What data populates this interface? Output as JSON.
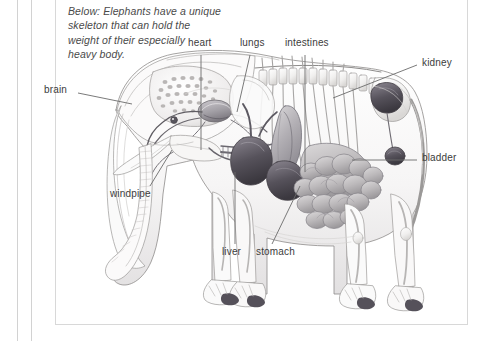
{
  "page": {
    "background": "#ffffff",
    "border_color": "#d8d8d8",
    "rule_color": "#d2d2d2"
  },
  "caption": {
    "text": "Below: Elephants have a unique skeleton that can hold the weight of their especially heavy body.",
    "line1": "Below: Elephants have a unique",
    "line2": "skeleton that can hold the",
    "line3": "weight of their especially",
    "line4": "heavy body.",
    "style": "italic",
    "color": "#4a4a4a"
  },
  "figure": {
    "ink_color": "#6f6f6f",
    "organ_fill_dark": "#4e4a52",
    "organ_fill_mid": "#9a979c",
    "organ_fill_light": "#cfcdd0",
    "bone_fill": "#f2f1f0",
    "toenail_fill": "#55515a"
  },
  "labels": [
    {
      "id": "brain",
      "text": "brain",
      "x": 44,
      "y": 89,
      "align": "left"
    },
    {
      "id": "heart",
      "text": "heart",
      "x": 188,
      "y": 42,
      "align": "left"
    },
    {
      "id": "lungs",
      "text": "lungs",
      "x": 240,
      "y": 42,
      "align": "left"
    },
    {
      "id": "intestines",
      "text": "intestines",
      "x": 285,
      "y": 42,
      "align": "left"
    },
    {
      "id": "kidney",
      "text": "kidney",
      "x": 420,
      "y": 62,
      "align": "left"
    },
    {
      "id": "bladder",
      "text": "bladder",
      "x": 420,
      "y": 157,
      "align": "left"
    },
    {
      "id": "windpipe",
      "text": "windpipe",
      "x": 110,
      "y": 193,
      "align": "left"
    },
    {
      "id": "liver",
      "text": "liver",
      "x": 222,
      "y": 251,
      "align": "left"
    },
    {
      "id": "stomach",
      "text": "stomach",
      "x": 256,
      "y": 251,
      "align": "left"
    }
  ],
  "leader_lines": [
    {
      "id": "lead-brain",
      "x1": 78,
      "y1": 93,
      "x2": 132,
      "y2": 104
    },
    {
      "id": "lead-heart",
      "x1": 201,
      "y1": 55,
      "x2": 201,
      "y2": 150
    },
    {
      "id": "lead-lungs",
      "x1": 250,
      "y1": 55,
      "x2": 237,
      "y2": 112
    },
    {
      "id": "lead-intestines",
      "x1": 305,
      "y1": 55,
      "x2": 305,
      "y2": 172
    },
    {
      "id": "lead-kidney",
      "x1": 417,
      "y1": 65,
      "x2": 333,
      "y2": 98
    },
    {
      "id": "lead-bladder",
      "x1": 417,
      "y1": 160,
      "x2": 352,
      "y2": 160
    },
    {
      "id": "lead-windpipe",
      "x1": 150,
      "y1": 186,
      "x2": 172,
      "y2": 150
    },
    {
      "id": "lead-liver",
      "x1": 235,
      "y1": 244,
      "x2": 235,
      "y2": 172
    },
    {
      "id": "lead-stomach",
      "x1": 272,
      "y1": 244,
      "x2": 300,
      "y2": 186
    }
  ]
}
